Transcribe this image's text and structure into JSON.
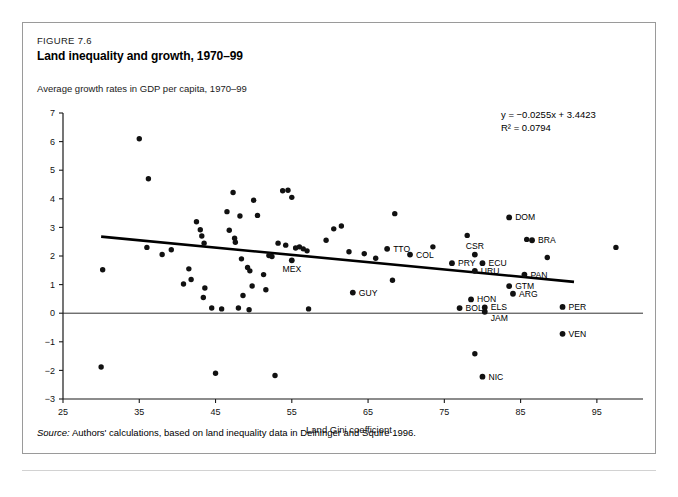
{
  "figure": {
    "number": "FIGURE 7.6",
    "title": "Land inequality and growth, 1970–99",
    "y_axis_note": "Average growth rates in GDP per capita, 1970–99",
    "source_prefix": "Source:",
    "source_text": "Authors' calculations, based on land inequality data in Deininger and Squire 1996."
  },
  "annotations": {
    "equation": "y = −0.0255x + 3.4423",
    "r_squared": "R² = 0.0794"
  },
  "chart_data": {
    "type": "scatter",
    "title": "Land inequality and growth, 1970–99",
    "xlabel": "Land Gini coefficient",
    "ylabel": "Average growth rates in GDP per capita, 1970–99",
    "xlim": [
      25,
      100
    ],
    "ylim": [
      -3,
      7
    ],
    "xticks": [
      25,
      35,
      45,
      55,
      65,
      75,
      85,
      95
    ],
    "yticks": [
      -3,
      -2,
      -1,
      0,
      1,
      2,
      3,
      4,
      5,
      6,
      7
    ],
    "grid": false,
    "legend": null,
    "zero_line": true,
    "trendline": {
      "equation": "y = -0.0255x + 3.4423",
      "slope": -0.0255,
      "intercept": 3.4423,
      "r2": 0.0794,
      "x_start": 30,
      "x_end": 92
    },
    "labeled_points": [
      {
        "label": "TTO",
        "x": 67.5,
        "y": 2.25,
        "label_pos": "right"
      },
      {
        "label": "MEX",
        "x": 55.0,
        "y": 1.85,
        "label_pos": "below"
      },
      {
        "label": "COL",
        "x": 70.5,
        "y": 2.05,
        "label_pos": "right"
      },
      {
        "label": "CSR",
        "x": 79.0,
        "y": 2.05,
        "label_pos": "above"
      },
      {
        "label": "PRY",
        "x": 76.0,
        "y": 1.75,
        "label_pos": "right"
      },
      {
        "label": "ECU",
        "x": 80.0,
        "y": 1.75,
        "label_pos": "right"
      },
      {
        "label": "URU",
        "x": 79.0,
        "y": 1.48,
        "label_pos": "right"
      },
      {
        "label": "DOM",
        "x": 83.5,
        "y": 3.35,
        "label_pos": "right"
      },
      {
        "label": "BRA",
        "x": 86.5,
        "y": 2.55,
        "label_pos": "right"
      },
      {
        "label": "PAN",
        "x": 85.5,
        "y": 1.35,
        "label_pos": "right"
      },
      {
        "label": "GTM",
        "x": 83.5,
        "y": 0.95,
        "label_pos": "right"
      },
      {
        "label": "ARG",
        "x": 84.0,
        "y": 0.68,
        "label_pos": "right"
      },
      {
        "label": "GUY",
        "x": 63.0,
        "y": 0.72,
        "label_pos": "right"
      },
      {
        "label": "HON",
        "x": 78.5,
        "y": 0.48,
        "label_pos": "right"
      },
      {
        "label": "BOL",
        "x": 77.0,
        "y": 0.18,
        "label_pos": "right"
      },
      {
        "label": "ELS",
        "x": 80.3,
        "y": 0.2,
        "label_pos": "right"
      },
      {
        "label": "JAM",
        "x": 80.3,
        "y": 0.05,
        "label_pos": "right-low"
      },
      {
        "label": "PER",
        "x": 90.5,
        "y": 0.22,
        "label_pos": "right"
      },
      {
        "label": "VEN",
        "x": 90.5,
        "y": -0.72,
        "label_pos": "right"
      },
      {
        "label": "NIC",
        "x": 80.0,
        "y": -2.22,
        "label_pos": "right"
      }
    ],
    "unlabeled_points": [
      {
        "x": 30.2,
        "y": 1.52
      },
      {
        "x": 30.0,
        "y": -1.88
      },
      {
        "x": 35.0,
        "y": 6.1
      },
      {
        "x": 36.2,
        "y": 4.7
      },
      {
        "x": 36.0,
        "y": 2.3
      },
      {
        "x": 38.0,
        "y": 2.05
      },
      {
        "x": 41.5,
        "y": 1.55
      },
      {
        "x": 42.5,
        "y": 3.2
      },
      {
        "x": 43.0,
        "y": 2.92
      },
      {
        "x": 43.2,
        "y": 2.7
      },
      {
        "x": 43.5,
        "y": 2.45
      },
      {
        "x": 40.8,
        "y": 1.02
      },
      {
        "x": 41.8,
        "y": 1.18
      },
      {
        "x": 43.6,
        "y": 0.88
      },
      {
        "x": 43.4,
        "y": 0.55
      },
      {
        "x": 44.5,
        "y": 0.18
      },
      {
        "x": 45.8,
        "y": 0.15
      },
      {
        "x": 45.0,
        "y": -2.1
      },
      {
        "x": 39.2,
        "y": 2.22
      },
      {
        "x": 46.5,
        "y": 3.55
      },
      {
        "x": 46.8,
        "y": 2.9
      },
      {
        "x": 47.3,
        "y": 4.22
      },
      {
        "x": 47.5,
        "y": 2.62
      },
      {
        "x": 47.6,
        "y": 2.48
      },
      {
        "x": 48.2,
        "y": 3.4
      },
      {
        "x": 48.4,
        "y": 1.9
      },
      {
        "x": 49.2,
        "y": 1.6
      },
      {
        "x": 49.5,
        "y": 1.48
      },
      {
        "x": 49.8,
        "y": 0.95
      },
      {
        "x": 48.6,
        "y": 0.62
      },
      {
        "x": 48.0,
        "y": 0.18
      },
      {
        "x": 49.4,
        "y": 0.12
      },
      {
        "x": 50.0,
        "y": 3.95
      },
      {
        "x": 50.5,
        "y": 3.42
      },
      {
        "x": 51.3,
        "y": 1.35
      },
      {
        "x": 51.6,
        "y": 0.82
      },
      {
        "x": 52.0,
        "y": 2.02
      },
      {
        "x": 52.4,
        "y": 1.98
      },
      {
        "x": 53.2,
        "y": 2.45
      },
      {
        "x": 53.8,
        "y": 4.28
      },
      {
        "x": 54.5,
        "y": 4.3
      },
      {
        "x": 55.0,
        "y": 4.05
      },
      {
        "x": 54.2,
        "y": 2.38
      },
      {
        "x": 55.5,
        "y": 2.28
      },
      {
        "x": 56.0,
        "y": 2.32
      },
      {
        "x": 56.5,
        "y": 2.25
      },
      {
        "x": 57.0,
        "y": 2.18
      },
      {
        "x": 57.2,
        "y": 0.15
      },
      {
        "x": 52.8,
        "y": -2.18
      },
      {
        "x": 59.5,
        "y": 2.55
      },
      {
        "x": 60.5,
        "y": 2.95
      },
      {
        "x": 61.5,
        "y": 3.05
      },
      {
        "x": 62.5,
        "y": 2.15
      },
      {
        "x": 64.5,
        "y": 2.08
      },
      {
        "x": 66.0,
        "y": 1.92
      },
      {
        "x": 68.5,
        "y": 3.48
      },
      {
        "x": 68.2,
        "y": 1.15
      },
      {
        "x": 73.5,
        "y": 2.32
      },
      {
        "x": 78.0,
        "y": 2.72
      },
      {
        "x": 85.8,
        "y": 2.58
      },
      {
        "x": 88.5,
        "y": 1.95
      },
      {
        "x": 79.0,
        "y": -1.42
      },
      {
        "x": 97.5,
        "y": 2.3
      }
    ]
  }
}
